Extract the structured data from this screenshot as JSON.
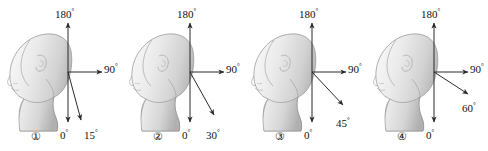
{
  "figure": {
    "width": 488,
    "height": 151,
    "background_color": "#ffffff",
    "axis_color": "#2b2b2b",
    "text_color": "#111111",
    "head_fill_light": "#f2f2f2",
    "head_fill_mid": "#d8d8d8",
    "head_fill_dark": "#b4b4b4",
    "head_outline": "#8f8f8f"
  },
  "panels": [
    {
      "index_label": "①",
      "labels": {
        "up": "180",
        "right": "90",
        "down": "0",
        "angled": "15"
      },
      "degree_symbol": "°",
      "angled_arrow_deg": 15
    },
    {
      "index_label": "②",
      "labels": {
        "up": "180",
        "right": "90",
        "down": "0",
        "angled": "30"
      },
      "degree_symbol": "°",
      "angled_arrow_deg": 30
    },
    {
      "index_label": "③",
      "labels": {
        "up": "180",
        "right": "90",
        "down": "0",
        "angled": "45"
      },
      "degree_symbol": "°",
      "angled_arrow_deg": 45
    },
    {
      "index_label": "④",
      "labels": {
        "up": "180",
        "right": "90",
        "down": "0",
        "angled": "60"
      },
      "degree_symbol": "°",
      "angled_arrow_deg": 60
    }
  ]
}
